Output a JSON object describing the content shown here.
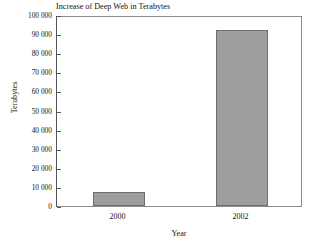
{
  "chart_data": {
    "type": "bar",
    "title": "Increase of Deep Web in Terabytes",
    "xlabel": "Year",
    "ylabel": "Terabytes",
    "categories": [
      "2000",
      "2002"
    ],
    "values": [
      7500,
      92000
    ],
    "ylim": [
      0,
      100000
    ],
    "ytick_step": 10000,
    "ytick_labels": [
      "100 000",
      "90 000",
      "80 000",
      "70 000",
      "60 000",
      "50 000",
      "40 000",
      "30 000",
      "20 000",
      "10 000",
      "0"
    ],
    "ytick_values": [
      100000,
      90000,
      80000,
      70000,
      60000,
      50000,
      40000,
      30000,
      20000,
      10000,
      0
    ],
    "grid": false,
    "legend": false,
    "bar_color": "#9e9e9e",
    "bar_edge_color": "#6e6e6e",
    "frame_color": "#8c8c8c",
    "background": "#ffffff",
    "series": [
      {
        "name": "Deep Web size",
        "values": [
          7500,
          92000
        ]
      }
    ]
  }
}
